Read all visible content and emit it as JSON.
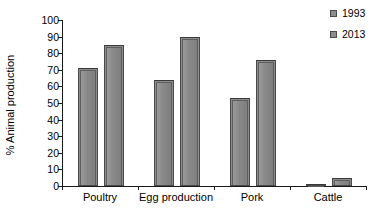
{
  "chart_data": {
    "type": "bar",
    "title": "",
    "subtitle": "",
    "xlabel": "",
    "ylabel": "% Animal production",
    "ylim": [
      0,
      100
    ],
    "ytick_step": 10,
    "yticks": [
      100,
      90,
      80,
      70,
      60,
      50,
      40,
      30,
      20,
      10,
      0
    ],
    "categories": [
      "Poultry",
      "Egg production",
      "Pork",
      "Cattle"
    ],
    "series": [
      {
        "name": "1993",
        "color": "#8c8c8c",
        "values": [
          71,
          64,
          53,
          1
        ]
      },
      {
        "name": "2013",
        "color": "#8c8c8c",
        "values": [
          85,
          90,
          76,
          5
        ]
      }
    ],
    "grid": false,
    "legend_position": "top-right",
    "annotations": []
  },
  "legend": {
    "items": [
      {
        "label": "1993"
      },
      {
        "label": "2013"
      }
    ]
  },
  "axes": {
    "y_title": "% Animal production"
  }
}
